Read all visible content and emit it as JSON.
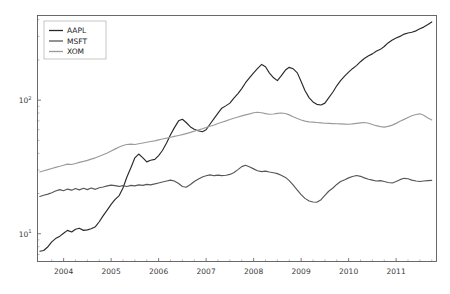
{
  "chart_data": {
    "type": "line",
    "title": "",
    "xlabel": "",
    "ylabel": "",
    "yscale": "log",
    "xscale": "linear",
    "grid": false,
    "legend_position": "upper left",
    "xlim": [
      2003.45,
      2011.85
    ],
    "ylim": [
      6.2,
      430
    ],
    "xticks": [
      2004,
      2005,
      2006,
      2007,
      2008,
      2009,
      2010,
      2011
    ],
    "xtick_labels": [
      "2004",
      "2005",
      "2006",
      "2007",
      "2008",
      "2009",
      "2010",
      "2011"
    ],
    "yticks": [
      10,
      100
    ],
    "ytick_labels": [
      "10¹",
      "10²"
    ],
    "ytick_bases": [
      "10",
      "10"
    ],
    "ytick_exponents": [
      "1",
      "2"
    ],
    "yticks_minor": [
      7,
      8,
      9,
      20,
      30,
      40,
      50,
      60,
      70,
      80,
      90,
      200,
      300,
      400
    ],
    "series": [
      {
        "name": "AAPL",
        "color": "#2a2a2a",
        "x": [
          2003.5,
          2003.58,
          2003.67,
          2003.75,
          2003.83,
          2003.92,
          2004.0,
          2004.08,
          2004.17,
          2004.25,
          2004.33,
          2004.42,
          2004.5,
          2004.58,
          2004.67,
          2004.75,
          2004.83,
          2004.92,
          2005.0,
          2005.08,
          2005.17,
          2005.25,
          2005.33,
          2005.42,
          2005.5,
          2005.58,
          2005.67,
          2005.75,
          2005.83,
          2005.92,
          2006.0,
          2006.08,
          2006.17,
          2006.25,
          2006.33,
          2006.42,
          2006.5,
          2006.58,
          2006.67,
          2006.75,
          2006.83,
          2006.92,
          2007.0,
          2007.08,
          2007.17,
          2007.25,
          2007.33,
          2007.42,
          2007.5,
          2007.58,
          2007.67,
          2007.75,
          2007.83,
          2007.92,
          2008.0,
          2008.08,
          2008.17,
          2008.25,
          2008.33,
          2008.42,
          2008.5,
          2008.58,
          2008.67,
          2008.75,
          2008.83,
          2008.92,
          2009.0,
          2009.08,
          2009.17,
          2009.25,
          2009.33,
          2009.42,
          2009.5,
          2009.58,
          2009.67,
          2009.75,
          2009.83,
          2009.92,
          2010.0,
          2010.08,
          2010.17,
          2010.25,
          2010.33,
          2010.42,
          2010.5,
          2010.58,
          2010.67,
          2010.75,
          2010.83,
          2010.92,
          2011.0,
          2011.08,
          2011.17,
          2011.25,
          2011.33,
          2011.42,
          2011.5,
          2011.58,
          2011.67,
          2011.75
        ],
        "y": [
          7.4,
          7.5,
          8.0,
          8.7,
          9.2,
          9.6,
          10.1,
          10.6,
          10.3,
          10.8,
          11.0,
          10.6,
          10.7,
          10.9,
          11.3,
          12.3,
          13.6,
          15.1,
          16.6,
          18.0,
          19.3,
          22.0,
          26.5,
          31.5,
          37.0,
          39.5,
          37.0,
          34.5,
          35.5,
          36.0,
          38.5,
          42.0,
          48.0,
          55.0,
          62.0,
          70.0,
          72.0,
          68.0,
          63.0,
          60.5,
          59.0,
          58.0,
          60.0,
          66.0,
          73.0,
          80.0,
          87.0,
          91.0,
          95.0,
          103.0,
          112.0,
          122.0,
          135.0,
          148.0,
          160.0,
          172.0,
          185.0,
          178.0,
          160.0,
          147.0,
          140.0,
          152.0,
          168.0,
          176.0,
          172.0,
          160.0,
          138.0,
          118.0,
          104.0,
          97.0,
          93.0,
          92.0,
          95.0,
          104.0,
          115.0,
          128.0,
          140.0,
          152.0,
          162.0,
          172.0,
          182.0,
          194.0,
          205.0,
          215.0,
          222.0,
          232.0,
          240.0,
          252.0,
          268.0,
          282.0,
          292.0,
          300.0,
          312.0,
          318.0,
          322.0,
          330.0,
          342.0,
          352.0,
          368.0,
          385.0
        ]
      },
      {
        "name": "MSFT",
        "color": "#575757",
        "x": [
          2003.5,
          2003.58,
          2003.67,
          2003.75,
          2003.83,
          2003.92,
          2004.0,
          2004.08,
          2004.17,
          2004.25,
          2004.33,
          2004.42,
          2004.5,
          2004.58,
          2004.67,
          2004.75,
          2004.83,
          2004.92,
          2005.0,
          2005.08,
          2005.17,
          2005.25,
          2005.33,
          2005.42,
          2005.5,
          2005.58,
          2005.67,
          2005.75,
          2005.83,
          2005.92,
          2006.0,
          2006.08,
          2006.17,
          2006.25,
          2006.33,
          2006.42,
          2006.5,
          2006.58,
          2006.67,
          2006.75,
          2006.83,
          2006.92,
          2007.0,
          2007.08,
          2007.17,
          2007.25,
          2007.33,
          2007.42,
          2007.5,
          2007.58,
          2007.67,
          2007.75,
          2007.83,
          2007.92,
          2008.0,
          2008.08,
          2008.17,
          2008.25,
          2008.33,
          2008.42,
          2008.5,
          2008.58,
          2008.67,
          2008.75,
          2008.83,
          2008.92,
          2009.0,
          2009.08,
          2009.17,
          2009.25,
          2009.33,
          2009.42,
          2009.5,
          2009.58,
          2009.67,
          2009.75,
          2009.83,
          2009.92,
          2010.0,
          2010.08,
          2010.17,
          2010.25,
          2010.33,
          2010.42,
          2010.5,
          2010.58,
          2010.67,
          2010.75,
          2010.83,
          2010.92,
          2011.0,
          2011.08,
          2011.17,
          2011.25,
          2011.33,
          2011.42,
          2011.5,
          2011.58,
          2011.67,
          2011.75
        ],
        "y": [
          19.0,
          19.4,
          19.8,
          20.3,
          20.9,
          21.4,
          21.0,
          21.6,
          21.2,
          21.8,
          21.3,
          21.9,
          21.4,
          22.0,
          21.5,
          22.1,
          22.4,
          22.8,
          23.1,
          22.9,
          22.6,
          22.9,
          22.6,
          23.0,
          22.8,
          23.2,
          23.0,
          23.4,
          23.2,
          23.6,
          24.0,
          24.4,
          24.8,
          25.2,
          24.8,
          23.8,
          22.6,
          22.3,
          23.4,
          24.6,
          25.6,
          26.6,
          27.2,
          27.6,
          27.2,
          27.5,
          27.2,
          27.4,
          27.8,
          28.6,
          30.2,
          31.8,
          32.6,
          31.6,
          30.6,
          29.6,
          29.2,
          29.4,
          29.0,
          28.6,
          28.2,
          27.4,
          26.4,
          25.0,
          23.2,
          21.2,
          19.6,
          18.4,
          17.6,
          17.3,
          17.2,
          18.0,
          19.4,
          20.8,
          22.0,
          23.4,
          24.6,
          25.4,
          26.2,
          26.8,
          27.3,
          26.9,
          26.2,
          25.6,
          25.2,
          24.8,
          25.0,
          24.6,
          24.2,
          24.0,
          24.6,
          25.4,
          26.0,
          25.8,
          25.2,
          24.8,
          24.6,
          24.8,
          25.0,
          25.1
        ]
      },
      {
        "name": "XOM",
        "color": "#9b9b9b",
        "x": [
          2003.5,
          2003.58,
          2003.67,
          2003.75,
          2003.83,
          2003.92,
          2004.0,
          2004.08,
          2004.17,
          2004.25,
          2004.33,
          2004.42,
          2004.5,
          2004.58,
          2004.67,
          2004.75,
          2004.83,
          2004.92,
          2005.0,
          2005.08,
          2005.17,
          2005.25,
          2005.33,
          2005.42,
          2005.5,
          2005.58,
          2005.67,
          2005.75,
          2005.83,
          2005.92,
          2006.0,
          2006.08,
          2006.17,
          2006.25,
          2006.33,
          2006.42,
          2006.5,
          2006.58,
          2006.67,
          2006.75,
          2006.83,
          2006.92,
          2007.0,
          2007.08,
          2007.17,
          2007.25,
          2007.33,
          2007.42,
          2007.5,
          2007.58,
          2007.67,
          2007.75,
          2007.83,
          2007.92,
          2008.0,
          2008.08,
          2008.17,
          2008.25,
          2008.33,
          2008.42,
          2008.5,
          2008.58,
          2008.67,
          2008.75,
          2008.83,
          2008.92,
          2009.0,
          2009.08,
          2009.17,
          2009.25,
          2009.33,
          2009.42,
          2009.5,
          2009.58,
          2009.67,
          2009.75,
          2009.83,
          2009.92,
          2010.0,
          2010.08,
          2010.17,
          2010.25,
          2010.33,
          2010.42,
          2010.5,
          2010.58,
          2010.67,
          2010.75,
          2010.83,
          2010.92,
          2011.0,
          2011.08,
          2011.17,
          2011.25,
          2011.33,
          2011.42,
          2011.5,
          2011.58,
          2011.67,
          2011.75
        ],
        "y": [
          29.0,
          29.6,
          30.2,
          30.8,
          31.4,
          32.0,
          32.6,
          33.2,
          33.0,
          33.6,
          34.2,
          34.8,
          35.4,
          36.2,
          37.0,
          38.0,
          39.0,
          40.2,
          41.6,
          43.0,
          44.6,
          45.8,
          46.6,
          46.9,
          46.6,
          47.2,
          47.8,
          48.4,
          49.0,
          49.6,
          50.4,
          51.2,
          52.0,
          52.8,
          53.6,
          54.4,
          55.2,
          56.2,
          57.4,
          58.6,
          59.8,
          61.0,
          62.4,
          63.8,
          65.2,
          66.8,
          68.4,
          70.0,
          71.6,
          73.2,
          74.8,
          76.2,
          77.6,
          79.0,
          80.4,
          81.2,
          80.4,
          79.2,
          78.4,
          78.8,
          79.6,
          80.2,
          79.4,
          77.6,
          75.2,
          72.8,
          71.0,
          69.6,
          68.8,
          68.4,
          68.0,
          67.6,
          67.2,
          67.0,
          66.8,
          66.6,
          66.4,
          66.2,
          66.0,
          66.4,
          67.0,
          67.6,
          68.0,
          67.2,
          65.8,
          64.4,
          63.4,
          62.8,
          63.6,
          65.0,
          67.0,
          69.4,
          71.8,
          74.2,
          76.4,
          78.0,
          79.0,
          77.0,
          73.6,
          71.0
        ]
      }
    ]
  },
  "legend": {
    "entries": [
      {
        "label": "AAPL"
      },
      {
        "label": "MSFT"
      },
      {
        "label": "XOM"
      }
    ]
  },
  "axes": {
    "x_tick_labels": [
      "2004",
      "2005",
      "2006",
      "2007",
      "2008",
      "2009",
      "2010",
      "2011"
    ],
    "y_tick_labels": [
      "10²",
      "10¹"
    ]
  },
  "colors": {
    "background": "#ffffff",
    "axis": "#5a5a5a",
    "text": "#3a3a3a",
    "aapl": "#2a2a2a",
    "msft": "#575757",
    "xom": "#9b9b9b"
  }
}
